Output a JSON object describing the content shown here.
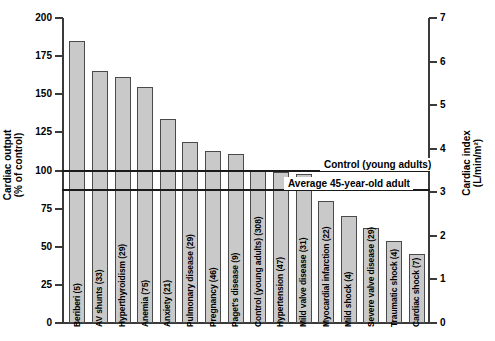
{
  "chart_data": {
    "type": "bar",
    "title": "",
    "ylabel": "Cardiac output\n(% of control)",
    "ylabel_right": "Cardiac index\n(L/min/m²)",
    "xlabel": "",
    "ylim": [
      0,
      200
    ],
    "ylim_right": [
      0,
      7
    ],
    "yticks": [
      "0",
      "25",
      "50",
      "75",
      "100",
      "125",
      "150",
      "175",
      "200"
    ],
    "yticks_right": [
      "0",
      "1",
      "2",
      "3",
      "4",
      "5",
      "6",
      "7"
    ],
    "grid": false,
    "legend": "none",
    "bar_color": "#c9c9c9",
    "bar_edge_color": "#4a4a4a",
    "categories": [
      "Beriberi (5)",
      "AV shunts (33)",
      "Hyperthyroidism (29)",
      "Anemia (75)",
      "Anxiety (21)",
      "Pulmonary disease (29)",
      "Pregnancy (46)",
      "Paget's disease (9)",
      "Control (young adults) (308)",
      "Hypertension (47)",
      "Mild valve disease (31)",
      "Myocardial infarction (22)",
      "Mild shock (4)",
      "Severe valve disease (29)",
      "Traumatic shock (4)",
      "Cardiac shock (7)"
    ],
    "values": [
      185,
      165,
      161,
      155,
      134,
      119,
      113,
      111,
      100,
      99,
      98,
      80,
      70,
      62,
      54,
      45
    ],
    "annotations": [
      {
        "label": "Control (young adults)",
        "value": 100
      },
      {
        "label": "Average 45-year-old adult",
        "value": 87
      }
    ]
  }
}
